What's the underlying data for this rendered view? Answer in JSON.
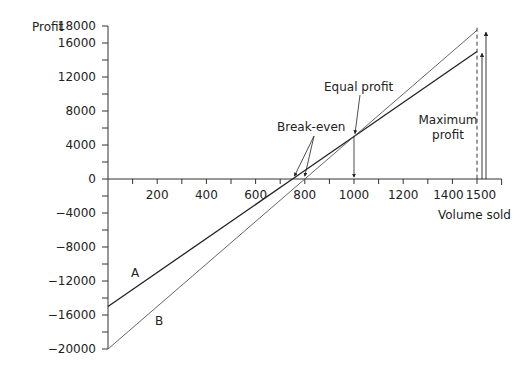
{
  "chart_data": {
    "type": "line",
    "title": "",
    "xlabel": "Volume sold",
    "ylabel": "Profit",
    "xlim": [
      0,
      1600
    ],
    "ylim": [
      -20000,
      18000
    ],
    "x_ticks": [
      200,
      400,
      600,
      800,
      1000,
      1200,
      1400,
      1500
    ],
    "y_ticks": [
      18000,
      16000,
      12000,
      8000,
      4000,
      0,
      -4000,
      -8000,
      -12000,
      -16000,
      -20000
    ],
    "grid": false,
    "series": [
      {
        "name": "A",
        "x": [
          0,
          750,
          1000,
          1500
        ],
        "y": [
          -15000,
          0,
          5000,
          15000
        ]
      },
      {
        "name": "B",
        "x": [
          0,
          800,
          1000,
          1500
        ],
        "y": [
          -20000,
          0,
          5000,
          17500
        ]
      }
    ],
    "annotations": [
      {
        "text": "Break-even",
        "points": [
          [
            750,
            0
          ],
          [
            800,
            0
          ]
        ]
      },
      {
        "text": "Equal profit",
        "point": [
          1000,
          5000
        ]
      },
      {
        "text": "Maximum profit",
        "x": 1500
      }
    ]
  },
  "labels": {
    "ylabel": "Profit",
    "xlabel": "Volume sold",
    "series_a": "A",
    "series_b": "B",
    "break_even": "Break-even",
    "equal_profit": "Equal profit",
    "max_profit_1": "Maximum",
    "max_profit_2": "profit"
  }
}
